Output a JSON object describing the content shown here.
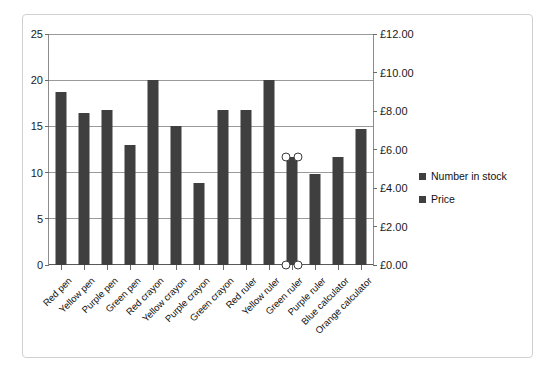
{
  "chart_data": {
    "type": "bar",
    "title": "",
    "xlabel": "",
    "ylabel": "",
    "grid": true,
    "legend_position": "right",
    "categories": [
      "Red pen",
      "Yellow pen",
      "Purple pen",
      "Green pen",
      "Red crayon",
      "Yellow crayon",
      "Purple crayon",
      "Green crayon",
      "Red ruler",
      "Yellow ruler",
      "Green ruler",
      "Purple ruler",
      "Blue calculator",
      "Orange calculator"
    ],
    "series": [
      {
        "name": "Number in stock",
        "axis": "left",
        "color": "#3f3f3f",
        "values": [
          18.7,
          16.4,
          16.8,
          13.0,
          20.0,
          15.0,
          8.9,
          16.8,
          16.8,
          20.0,
          11.7,
          9.9,
          11.7,
          14.7
        ]
      },
      {
        "name": "Price",
        "axis": "right",
        "color": "#3f3f3f",
        "values": [
          0,
          0,
          0,
          0,
          0,
          0,
          0,
          0,
          0,
          0,
          0,
          0,
          0,
          0
        ]
      }
    ],
    "left_axis": {
      "min": 0,
      "max": 25,
      "step": 5,
      "ticks": [
        "0",
        "5",
        "10",
        "15",
        "20",
        "25"
      ]
    },
    "right_axis": {
      "min": 0,
      "max": 12,
      "step": 2,
      "ticks": [
        "£0.00",
        "£2.00",
        "£4.00",
        "£6.00",
        "£8.00",
        "£10.00",
        "£12.00"
      ]
    },
    "selected_point": {
      "category": "Green ruler",
      "index": 10,
      "series": "Number in stock"
    }
  },
  "legend": {
    "items": [
      {
        "label": "Number in stock",
        "color": "#3f3f3f"
      },
      {
        "label": "Price",
        "color": "#3f3f3f"
      }
    ]
  }
}
